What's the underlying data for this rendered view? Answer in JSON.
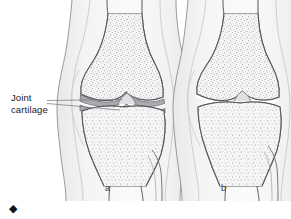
{
  "figure": {
    "type": "medical-illustration",
    "annotations": {
      "joint_cartilage_line1": "Joint",
      "joint_cartilage_line2": "cartilage"
    },
    "panels": [
      {
        "letter": "a",
        "description": "knee with intact joint cartilage"
      },
      {
        "letter": "b",
        "description": "knee with worn joint cartilage"
      }
    ],
    "bullet": "◆",
    "colors": {
      "background": "#ffffff",
      "soft_tissue": "#f0f0f0",
      "soft_tissue_edge": "#d8d8d8",
      "bone_fill": "#f5f5f5",
      "bone_outline": "#55565a",
      "bone_stipple": "#8e9095",
      "cartilage": "#a9abb0",
      "cartilage_edge": "#6e7075",
      "leader_line": "#7a7c80",
      "text": "#1a1a1a",
      "letter": "#3b3b3b",
      "bullet": "#111111"
    }
  }
}
